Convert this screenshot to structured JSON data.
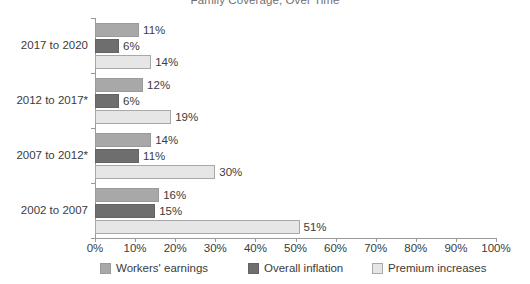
{
  "chart_data": {
    "type": "bar",
    "orientation": "horizontal",
    "title": "Family Coverage, Over Time",
    "xlabel": "",
    "ylabel": "",
    "xlim": [
      0,
      100
    ],
    "grid": false,
    "legend_position": "bottom",
    "categories": [
      "2017 to 2020",
      "2012 to 2017*",
      "2007 to 2012*",
      "2002 to 2007"
    ],
    "xticks": [
      "0%",
      "10%",
      "20%",
      "30%",
      "40%",
      "50%",
      "60%",
      "70%",
      "80%",
      "90%",
      "100%"
    ],
    "series": [
      {
        "name": "Workers' earnings",
        "color": "#a8a8a8",
        "values": [
          11,
          12,
          14,
          16
        ],
        "labels": [
          "11%",
          "12%",
          "14%",
          "16%"
        ]
      },
      {
        "name": "Overall inflation",
        "color": "#6e6e6e",
        "values": [
          6,
          6,
          11,
          15
        ],
        "labels": [
          "6%",
          "6%",
          "11%",
          "15%"
        ]
      },
      {
        "name": "Premium increases",
        "color": "#e6e6e6",
        "values": [
          14,
          19,
          30,
          51
        ],
        "labels": [
          "14%",
          "19%",
          "30%",
          "51%"
        ]
      }
    ]
  }
}
